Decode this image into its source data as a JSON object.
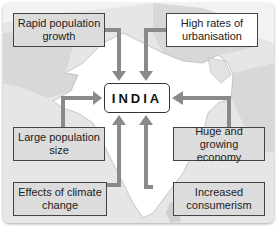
{
  "diagram": {
    "center_label": "INDIA",
    "factors": [
      {
        "id": "rapid-population-growth",
        "label_line1": "Rapid population",
        "label_line2": "growth",
        "position": "top-left",
        "style": "grey"
      },
      {
        "id": "high-rates-of-urbanisation",
        "label_line1": "High rates of",
        "label_line2": "urbanisation",
        "position": "top-right",
        "style": "white"
      },
      {
        "id": "large-population-size",
        "label_line1": "Large population",
        "label_line2": "size",
        "position": "middle-left",
        "style": "grey"
      },
      {
        "id": "huge-and-growing-economy",
        "label_line1": "Huge and growing",
        "label_line2": "economy",
        "position": "middle-right",
        "style": "grey"
      },
      {
        "id": "effects-of-climate-change",
        "label_line1": "Effects of climate",
        "label_line2": "change",
        "position": "bottom-left",
        "style": "grey"
      },
      {
        "id": "increased-consumerism",
        "label_line1": "Increased",
        "label_line2": "consumerism",
        "position": "bottom-right",
        "style": "grey"
      }
    ],
    "colors": {
      "arrow": "#8a8a8a",
      "map_land": "#d6d6d6",
      "map_india": "#ffffff",
      "box_grey": "#dcdcdc"
    }
  }
}
